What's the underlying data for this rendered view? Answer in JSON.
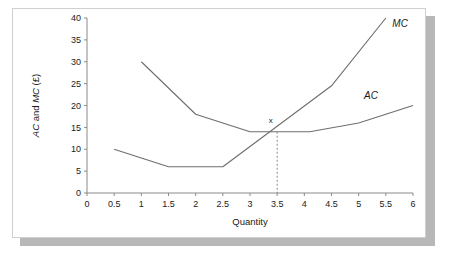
{
  "figure": {
    "background_color": "#ffffff",
    "card_border_color": "#cfcfcf",
    "shadow_color": "#b8b8b8",
    "line_color": "#6e6e6e",
    "axis_color": "#8a8a8a"
  },
  "chart_data": {
    "type": "line",
    "title": "",
    "xlabel": "Quantity",
    "ylabel": "AC and MC (£)",
    "ylabel_parts": {
      "ac": "AC",
      "and": " and ",
      "mc": "MC",
      "unit": " (£)"
    },
    "xlim": [
      0,
      6
    ],
    "ylim": [
      0,
      40
    ],
    "grid": false,
    "legend": "inline-labels",
    "xticks": [
      0,
      0.5,
      1,
      1.5,
      2,
      2.5,
      3,
      3.5,
      4,
      4.5,
      5,
      5.5,
      6
    ],
    "xticklabels": [
      "0",
      "0.5",
      "1",
      "1.5",
      "2",
      "2.5",
      "3",
      "3.5",
      "4",
      "4.5",
      "5",
      "5.5",
      "6"
    ],
    "yticks": [
      0,
      5,
      10,
      15,
      20,
      25,
      30,
      35,
      40
    ],
    "yticklabels": [
      "0",
      "5",
      "10",
      "15",
      "20",
      "25",
      "30",
      "35",
      "40"
    ],
    "series": [
      {
        "name": "MC",
        "label": "MC",
        "label_x": 5.62,
        "label_y": 38.0,
        "points": [
          {
            "x": 0.5,
            "y": 10
          },
          {
            "x": 1.5,
            "y": 6
          },
          {
            "x": 2.5,
            "y": 6
          },
          {
            "x": 4.5,
            "y": 24.5
          },
          {
            "x": 5.5,
            "y": 40
          }
        ]
      },
      {
        "name": "AC",
        "label": "AC",
        "label_x": 5.1,
        "label_y": 21.5,
        "points": [
          {
            "x": 1.0,
            "y": 30
          },
          {
            "x": 2.0,
            "y": 18
          },
          {
            "x": 3.0,
            "y": 14
          },
          {
            "x": 4.1,
            "y": 14
          },
          {
            "x": 5.0,
            "y": 16
          },
          {
            "x": 6.0,
            "y": 20
          }
        ]
      }
    ],
    "annotations": [
      {
        "name": "intersection-marker",
        "label": "x",
        "x": 3.5,
        "y": 14,
        "label_offset_x": -0.12,
        "label_offset_y": 1.9,
        "dropline": {
          "from_y": 14,
          "to_y": 0,
          "style": "dashed"
        }
      }
    ]
  }
}
